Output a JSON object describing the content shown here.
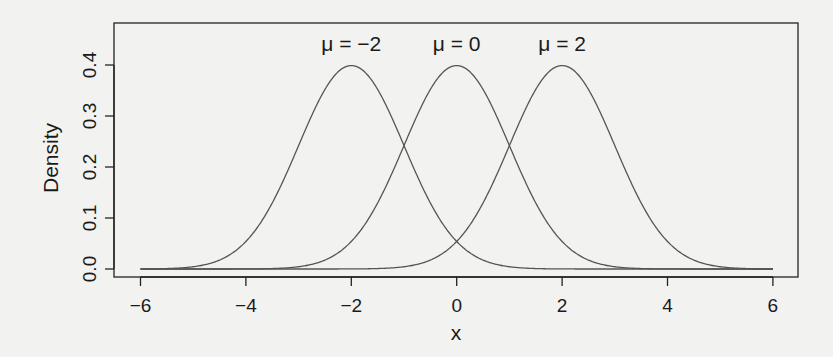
{
  "chart_data": {
    "type": "line",
    "title": "",
    "xlabel": "x",
    "ylabel": "Density",
    "xlim": [
      -6,
      6
    ],
    "ylim": [
      0,
      0.4
    ],
    "x_ticks": [
      "-6",
      "-4",
      "-2",
      "0",
      "2",
      "4",
      "6"
    ],
    "y_ticks": [
      "0.0",
      "0.1",
      "0.2",
      "0.3",
      "0.4"
    ],
    "grid": false,
    "series": [
      {
        "name": "μ = −2",
        "mean": -2,
        "sd": 1
      },
      {
        "name": "μ = 0",
        "mean": 0,
        "sd": 1
      },
      {
        "name": "μ = 2",
        "mean": 2,
        "sd": 1
      }
    ],
    "annotations": [
      {
        "text": "μ = −2",
        "x": -2,
        "y": 0.445
      },
      {
        "text": "μ = 0",
        "x": 0,
        "y": 0.445
      },
      {
        "text": "μ = 2",
        "x": 2,
        "y": 0.445
      }
    ]
  },
  "colors": {
    "line": "#555555",
    "axis": "#222222",
    "background": "#f2f2f0"
  }
}
